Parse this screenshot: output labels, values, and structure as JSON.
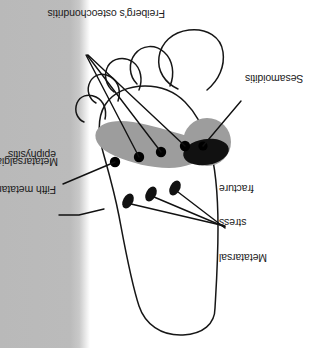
{
  "figure": {
    "orientation_note": "Diagram printed upside down (rotated 180 degrees)",
    "background_color": "#ffffff",
    "scan_band_color": "#b9b9b9",
    "outline_color": "#161616",
    "shaded_band_color": "#9d9d9d",
    "dark_region_color": "#111111",
    "marker_color": "#000000"
  },
  "labels": [
    {
      "id": "metatarsal-stress-fracture",
      "lines": [
        "Metatarsal",
        "stress",
        "fracture"
      ],
      "text": "Metatarsal stress fracture",
      "align": "right",
      "leader_count": 3
    },
    {
      "id": "fifth-metatarsal-epiphysitis",
      "lines": [
        "Fifth metatarsal",
        "epiphysitis"
      ],
      "text": "Fifth metatarsal epiphysitis",
      "align": "left",
      "leader_count": 1
    },
    {
      "id": "metatarsalgia",
      "lines": [
        "Metatarsalgia"
      ],
      "text": "Metatarsalgia",
      "align": "left",
      "leader_count": 1
    },
    {
      "id": "sesamoiditis",
      "lines": [
        "Sesamoiditis"
      ],
      "text": "Sesamoiditis",
      "align": "right",
      "leader_count": 1
    },
    {
      "id": "freibergs-osteochondritis",
      "lines": [
        "Freiberg's osteochondritis"
      ],
      "text": "Freiberg's osteochondritis",
      "align": "center",
      "leader_count": 3
    }
  ]
}
